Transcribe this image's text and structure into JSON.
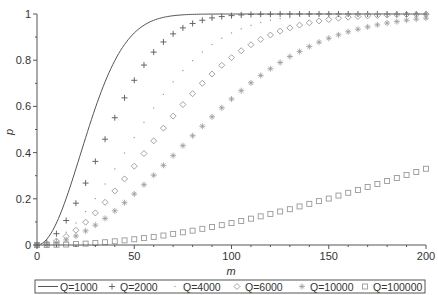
{
  "chart_data": {
    "type": "line",
    "title": "",
    "xlabel": "m",
    "ylabel": "p",
    "xlim": [
      0,
      200
    ],
    "ylim": [
      0,
      1
    ],
    "x_ticks": [
      0,
      50,
      100,
      150,
      200
    ],
    "y_ticks": [
      0,
      0.2,
      0.4,
      0.6,
      0.8,
      1
    ],
    "y_tick_labels": [
      "0",
      "0.2",
      "0.4",
      "0.6",
      "0.8",
      "1"
    ],
    "grid": false,
    "legend_position": "bottom",
    "x": [
      0,
      5,
      10,
      15,
      20,
      25,
      30,
      35,
      40,
      45,
      50,
      55,
      60,
      65,
      70,
      75,
      80,
      85,
      90,
      95,
      100,
      105,
      110,
      115,
      120,
      125,
      130,
      135,
      140,
      145,
      150,
      155,
      160,
      165,
      170,
      175,
      180,
      185,
      190,
      195,
      200
    ],
    "series": [
      {
        "name": "Q=1000",
        "marker": "line",
        "values": [
          0,
          0.025,
          0.095,
          0.201,
          0.33,
          0.465,
          0.593,
          0.706,
          0.798,
          0.868,
          0.918,
          0.951,
          0.973,
          0.985,
          0.993,
          0.996,
          0.998,
          0.999,
          1,
          1,
          1,
          1,
          1,
          1,
          1,
          1,
          1,
          1,
          1,
          1,
          1,
          1,
          1,
          1,
          1,
          1,
          1,
          1,
          1,
          1,
          1
        ]
      },
      {
        "name": "Q=2000",
        "marker": "plus",
        "values": [
          0,
          0.012,
          0.049,
          0.106,
          0.181,
          0.268,
          0.362,
          0.458,
          0.551,
          0.637,
          0.713,
          0.779,
          0.835,
          0.879,
          0.914,
          0.94,
          0.959,
          0.973,
          0.983,
          0.989,
          0.993,
          0.996,
          0.998,
          0.999,
          0.999,
          1,
          1,
          1,
          1,
          1,
          1,
          1,
          1,
          1,
          1,
          1,
          1,
          1,
          1,
          1,
          1
        ]
      },
      {
        "name": "Q=4000",
        "marker": "dot",
        "values": [
          0,
          0.006,
          0.025,
          0.055,
          0.095,
          0.145,
          0.201,
          0.264,
          0.33,
          0.398,
          0.465,
          0.531,
          0.593,
          0.652,
          0.706,
          0.755,
          0.798,
          0.836,
          0.868,
          0.895,
          0.918,
          0.936,
          0.951,
          0.963,
          0.973,
          0.98,
          0.985,
          0.989,
          0.993,
          0.995,
          0.996,
          0.997,
          0.998,
          0.999,
          0.999,
          1,
          1,
          1,
          1,
          1,
          1
        ]
      },
      {
        "name": "Q=6000",
        "marker": "diamond",
        "values": [
          0,
          0.004,
          0.017,
          0.037,
          0.064,
          0.099,
          0.139,
          0.185,
          0.234,
          0.286,
          0.341,
          0.396,
          0.451,
          0.506,
          0.558,
          0.608,
          0.655,
          0.7,
          0.74,
          0.778,
          0.811,
          0.841,
          0.867,
          0.89,
          0.909,
          0.926,
          0.94,
          0.952,
          0.962,
          0.97,
          0.976,
          0.982,
          0.986,
          0.989,
          0.992,
          0.994,
          0.995,
          0.997,
          0.998,
          0.998,
          0.999
        ]
      },
      {
        "name": "Q=10000",
        "marker": "asterisk",
        "values": [
          0,
          0.002,
          0.01,
          0.022,
          0.039,
          0.061,
          0.086,
          0.115,
          0.148,
          0.183,
          0.221,
          0.261,
          0.302,
          0.345,
          0.387,
          0.43,
          0.473,
          0.514,
          0.555,
          0.594,
          0.632,
          0.668,
          0.702,
          0.734,
          0.763,
          0.79,
          0.816,
          0.838,
          0.859,
          0.878,
          0.895,
          0.91,
          0.923,
          0.934,
          0.944,
          0.953,
          0.961,
          0.967,
          0.973,
          0.978,
          0.982
        ]
      },
      {
        "name": "Q=100000",
        "marker": "square",
        "values": [
          0,
          0.0,
          0.001,
          0.002,
          0.004,
          0.006,
          0.009,
          0.012,
          0.016,
          0.02,
          0.025,
          0.03,
          0.035,
          0.041,
          0.048,
          0.055,
          0.062,
          0.07,
          0.078,
          0.086,
          0.095,
          0.104,
          0.114,
          0.124,
          0.134,
          0.145,
          0.155,
          0.167,
          0.178,
          0.19,
          0.201,
          0.214,
          0.226,
          0.238,
          0.251,
          0.264,
          0.277,
          0.29,
          0.303,
          0.316,
          0.33
        ]
      }
    ]
  },
  "colors": {
    "axis": "#555555",
    "curve": "#555555",
    "marker_dark": "#666666",
    "marker_light": "#999999",
    "legend_border": "#555555"
  }
}
